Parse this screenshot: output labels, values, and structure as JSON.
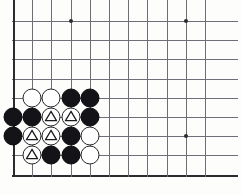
{
  "figure": {
    "kind": "go-board-diagram",
    "title": "",
    "board_size": 19,
    "visible_region": {
      "columns": 11,
      "rows": 9,
      "left_edge_is_board_edge": true,
      "bottom_edge_is_board_edge": true,
      "top_edge_is_board_edge": false,
      "right_edge_is_board_edge": false
    },
    "geometry": {
      "origin_x": 13,
      "origin_y": 21,
      "spacing": 19.2,
      "stone_diameter": 19,
      "line_color": "#6e6e78",
      "edge_color": "#2b2b30",
      "background_color": "#fdfdfb",
      "black_color": "#141418",
      "white_color": "#ffffff"
    },
    "star_points": [
      {
        "col": 3,
        "row": 0
      },
      {
        "col": 9,
        "row": 0
      },
      {
        "col": 9,
        "row": 6
      }
    ],
    "stones": [
      {
        "col": 1,
        "row": 4,
        "color": "white",
        "mark": ""
      },
      {
        "col": 2,
        "row": 4,
        "color": "white",
        "mark": ""
      },
      {
        "col": 3,
        "row": 4,
        "color": "black",
        "mark": ""
      },
      {
        "col": 4,
        "row": 4,
        "color": "black",
        "mark": ""
      },
      {
        "col": 0,
        "row": 5,
        "color": "black",
        "mark": ""
      },
      {
        "col": 1,
        "row": 5,
        "color": "black",
        "mark": ""
      },
      {
        "col": 2,
        "row": 5,
        "color": "white",
        "mark": "triangle"
      },
      {
        "col": 3,
        "row": 5,
        "color": "white",
        "mark": "triangle"
      },
      {
        "col": 4,
        "row": 5,
        "color": "black",
        "mark": ""
      },
      {
        "col": 0,
        "row": 6,
        "color": "black",
        "mark": ""
      },
      {
        "col": 1,
        "row": 6,
        "color": "white",
        "mark": "triangle"
      },
      {
        "col": 2,
        "row": 6,
        "color": "white",
        "mark": "triangle"
      },
      {
        "col": 3,
        "row": 6,
        "color": "black",
        "mark": ""
      },
      {
        "col": 4,
        "row": 6,
        "color": "white",
        "mark": ""
      },
      {
        "col": 1,
        "row": 7,
        "color": "white",
        "mark": "triangle"
      },
      {
        "col": 2,
        "row": 7,
        "color": "black",
        "mark": ""
      },
      {
        "col": 3,
        "row": 7,
        "color": "black",
        "mark": ""
      },
      {
        "col": 4,
        "row": 7,
        "color": "white",
        "mark": ""
      }
    ],
    "marks_legend": {
      "triangle": "triangle-marked white stones"
    },
    "counts": {
      "black_stones": 9,
      "white_stones": 9,
      "triangle_marked": 5
    }
  }
}
